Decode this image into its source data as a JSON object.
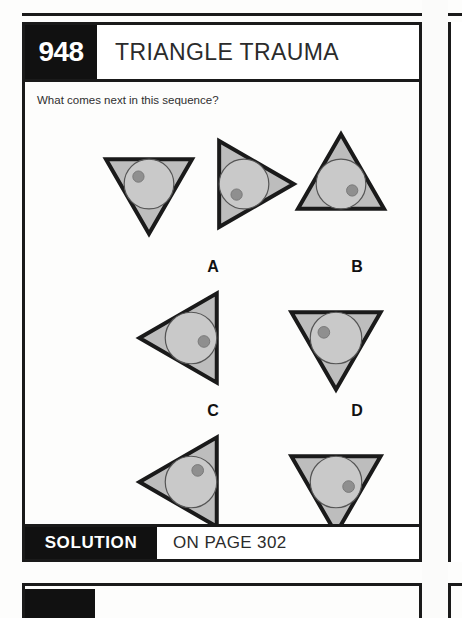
{
  "page": {
    "background_color": "#fdfdfc",
    "rule_color": "#1a1a1a"
  },
  "card": {
    "header": {
      "number": "948",
      "title": "TRIANGLE TRAUMA",
      "number_bg": "#111111",
      "number_fg": "#ffffff",
      "title_fg": "#2b2b2b"
    },
    "question": "What comes next in this sequence?",
    "footer": {
      "tag": "SOLUTION",
      "page_text": "ON PAGE 302",
      "tag_bg": "#111111",
      "tag_fg": "#ffffff"
    }
  },
  "figure_style": {
    "triangle_fill": "#bdbdbd",
    "triangle_stroke": "#1a1a1a",
    "triangle_stroke_width": 4,
    "circle_fill": "#c9c9c9",
    "circle_stroke": "#555555",
    "dot_fill": "#8f8f8f",
    "dot_stroke": "#7a7a7a"
  },
  "sequence": {
    "label": "sequence",
    "items": [
      {
        "id": "seq-1",
        "name": "sequence-figure-1",
        "x": 70,
        "y": 48,
        "size": 108,
        "triangle_rotation_deg": 180,
        "dot_angle_deg": 215,
        "dot_radius_ratio": 0.52,
        "description": "triangle pointing down, dot upper-left in circle"
      },
      {
        "id": "seq-2",
        "name": "sequence-figure-2",
        "x": 165,
        "y": 48,
        "size": 108,
        "triangle_rotation_deg": 90,
        "dot_angle_deg": 125,
        "dot_radius_ratio": 0.52,
        "description": "triangle pointing right, dot lower-left in circle"
      },
      {
        "id": "seq-3",
        "name": "sequence-figure-3",
        "x": 262,
        "y": 48,
        "size": 108,
        "triangle_rotation_deg": 0,
        "dot_angle_deg": 30,
        "dot_radius_ratio": 0.52,
        "description": "triangle pointing up, dot right in circle"
      }
    ]
  },
  "options": {
    "label": "answer options",
    "items": [
      {
        "id": "opt-A",
        "letter": "A",
        "name": "option-a",
        "label_x": 173,
        "label_y": 176,
        "x": 110,
        "y": 200,
        "size": 112,
        "triangle_rotation_deg": 270,
        "dot_angle_deg": 15,
        "dot_radius_ratio": 0.52,
        "description": "triangle pointing left, dot right in circle"
      },
      {
        "id": "opt-B",
        "letter": "B",
        "name": "option-b",
        "label_x": 317,
        "label_y": 176,
        "x": 255,
        "y": 200,
        "size": 112,
        "triangle_rotation_deg": 180,
        "dot_angle_deg": 205,
        "dot_radius_ratio": 0.52,
        "description": "triangle pointing down, dot upper-left in circle"
      },
      {
        "id": "opt-C",
        "letter": "C",
        "name": "option-c",
        "label_x": 173,
        "label_y": 320,
        "x": 110,
        "y": 344,
        "size": 112,
        "triangle_rotation_deg": 270,
        "dot_angle_deg": 300,
        "dot_radius_ratio": 0.52,
        "description": "triangle pointing left, dot top in circle"
      },
      {
        "id": "opt-D",
        "letter": "D",
        "name": "option-d",
        "label_x": 317,
        "label_y": 320,
        "x": 255,
        "y": 344,
        "size": 112,
        "triangle_rotation_deg": 180,
        "dot_angle_deg": 20,
        "dot_radius_ratio": 0.52,
        "description": "triangle pointing down, dot right in circle"
      }
    ]
  }
}
